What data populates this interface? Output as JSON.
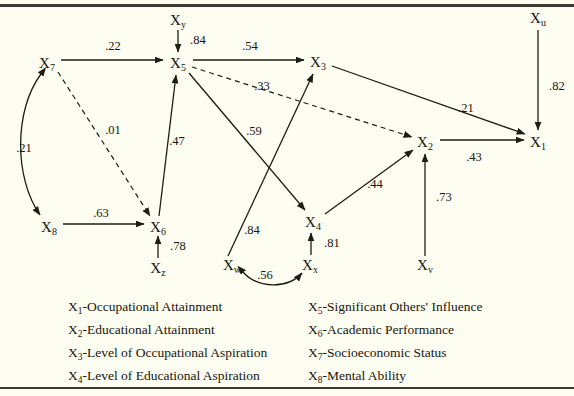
{
  "figure": {
    "type": "path-diagram",
    "title": "",
    "background_color": "#fdfdf2",
    "ink_color": "#1d1d14"
  },
  "nodes": [
    {
      "id": "X1",
      "base": "X",
      "sub": "1",
      "x": 538,
      "y": 142,
      "kind": "observed"
    },
    {
      "id": "X2",
      "base": "X",
      "sub": "2",
      "x": 425,
      "y": 142,
      "kind": "observed"
    },
    {
      "id": "X3",
      "base": "X",
      "sub": "3",
      "x": 318,
      "y": 62,
      "kind": "observed"
    },
    {
      "id": "X4",
      "base": "X",
      "sub": "4",
      "x": 313,
      "y": 222,
      "kind": "observed"
    },
    {
      "id": "X5",
      "base": "X",
      "sub": "5",
      "x": 178,
      "y": 63,
      "kind": "observed"
    },
    {
      "id": "X6",
      "base": "X",
      "sub": "6",
      "x": 158,
      "y": 227,
      "kind": "observed"
    },
    {
      "id": "X7",
      "base": "X",
      "sub": "7",
      "x": 47,
      "y": 63,
      "kind": "observed"
    },
    {
      "id": "X8",
      "base": "X",
      "sub": "8",
      "x": 49,
      "y": 227,
      "kind": "observed"
    },
    {
      "id": "Xu",
      "base": "X",
      "sub": "u",
      "x": 538,
      "y": 18,
      "kind": "residual"
    },
    {
      "id": "Xv",
      "base": "X",
      "sub": "v",
      "x": 425,
      "y": 265,
      "kind": "residual"
    },
    {
      "id": "Xw",
      "base": "X",
      "sub": "w",
      "x": 232,
      "y": 265,
      "kind": "residual"
    },
    {
      "id": "Xx",
      "base": "X",
      "sub": "x",
      "x": 310,
      "y": 265,
      "kind": "residual"
    },
    {
      "id": "Xy",
      "base": "X",
      "sub": "y",
      "x": 178,
      "y": 20,
      "kind": "residual"
    },
    {
      "id": "Xz",
      "base": "X",
      "sub": "z",
      "x": 158,
      "y": 268,
      "kind": "residual"
    }
  ],
  "edges": [
    {
      "from": "X7",
      "to": "X5",
      "coefficient": ".22",
      "style": "solid",
      "arrow": "single",
      "label_x": 113,
      "label_y": 50
    },
    {
      "from": "Xy",
      "to": "X5",
      "coefficient": ".84",
      "style": "solid",
      "arrow": "single",
      "label_x": 190,
      "label_y": 44
    },
    {
      "from": "X5",
      "to": "X3",
      "coefficient": ".54",
      "style": "solid",
      "arrow": "single",
      "label_x": 250,
      "label_y": 50
    },
    {
      "from": "X5",
      "to": "X2",
      "coefficient": ".33",
      "style": "dashed",
      "arrow": "single",
      "label_x": 262,
      "label_y": 90
    },
    {
      "from": "X7",
      "to": "X6",
      "coefficient": ".01",
      "style": "dashed",
      "arrow": "single",
      "label_x": 113,
      "label_y": 134
    },
    {
      "from": "X7",
      "to": "X8",
      "coefficient": ".21",
      "style": "solid",
      "arrow": "double",
      "label_x": 24,
      "label_y": 152
    },
    {
      "from": "X6",
      "to": "X5",
      "coefficient": ".47",
      "style": "solid",
      "arrow": "single",
      "label_x": 177,
      "label_y": 145
    },
    {
      "from": "X8",
      "to": "X6",
      "coefficient": ".63",
      "style": "solid",
      "arrow": "single",
      "label_x": 101,
      "label_y": 217
    },
    {
      "from": "Xz",
      "to": "X6",
      "coefficient": ".78",
      "style": "solid",
      "arrow": "single",
      "label_x": 170,
      "label_y": 250
    },
    {
      "from": "X5",
      "to": "X4",
      "coefficient": ".59",
      "style": "solid",
      "arrow": "single",
      "label_x": 254,
      "label_y": 135
    },
    {
      "from": "Xw",
      "to": "X3",
      "coefficient": ".84",
      "style": "solid",
      "arrow": "single",
      "label_x": 252,
      "label_y": 234
    },
    {
      "from": "Xx",
      "to": "X4",
      "coefficient": ".81",
      "style": "solid",
      "arrow": "single",
      "label_x": 324,
      "label_y": 247
    },
    {
      "from": "Xw",
      "to": "Xx",
      "coefficient": ".56",
      "style": "solid",
      "arrow": "double",
      "label_x": 265,
      "label_y": 279
    },
    {
      "from": "X4",
      "to": "X2",
      "coefficient": ".44",
      "style": "solid",
      "arrow": "single",
      "label_x": 375,
      "label_y": 188
    },
    {
      "from": "Xv",
      "to": "X2",
      "coefficient": ".73",
      "style": "solid",
      "arrow": "single",
      "label_x": 436,
      "label_y": 201
    },
    {
      "from": "X3",
      "to": "X1",
      "coefficient": ".21",
      "style": "solid",
      "arrow": "single",
      "label_x": 466,
      "label_y": 112
    },
    {
      "from": "X2",
      "to": "X1",
      "coefficient": ".43",
      "style": "solid",
      "arrow": "single",
      "label_x": 474,
      "label_y": 161
    },
    {
      "from": "Xu",
      "to": "X1",
      "coefficient": ".82",
      "style": "solid",
      "arrow": "single",
      "label_x": 549,
      "label_y": 90
    }
  ],
  "legend": {
    "left_column": [
      {
        "variable": "X",
        "subscript": "1",
        "description": "-Occupational Attainment"
      },
      {
        "variable": "X",
        "subscript": "2",
        "description": "-Educational Attainment"
      },
      {
        "variable": "X",
        "subscript": "3",
        "description": "-Level of Occupational Aspiration"
      },
      {
        "variable": "X",
        "subscript": "4",
        "description": "-Level of Educational Aspiration"
      }
    ],
    "right_column": [
      {
        "variable": "X",
        "subscript": "5",
        "description": "-Significant Others' Influence"
      },
      {
        "variable": "X",
        "subscript": "6",
        "description": "-Academic Performance"
      },
      {
        "variable": "X",
        "subscript": "7",
        "description": "-Socioeconomic Status"
      },
      {
        "variable": "X",
        "subscript": "8",
        "description": "-Mental Ability"
      }
    ]
  }
}
